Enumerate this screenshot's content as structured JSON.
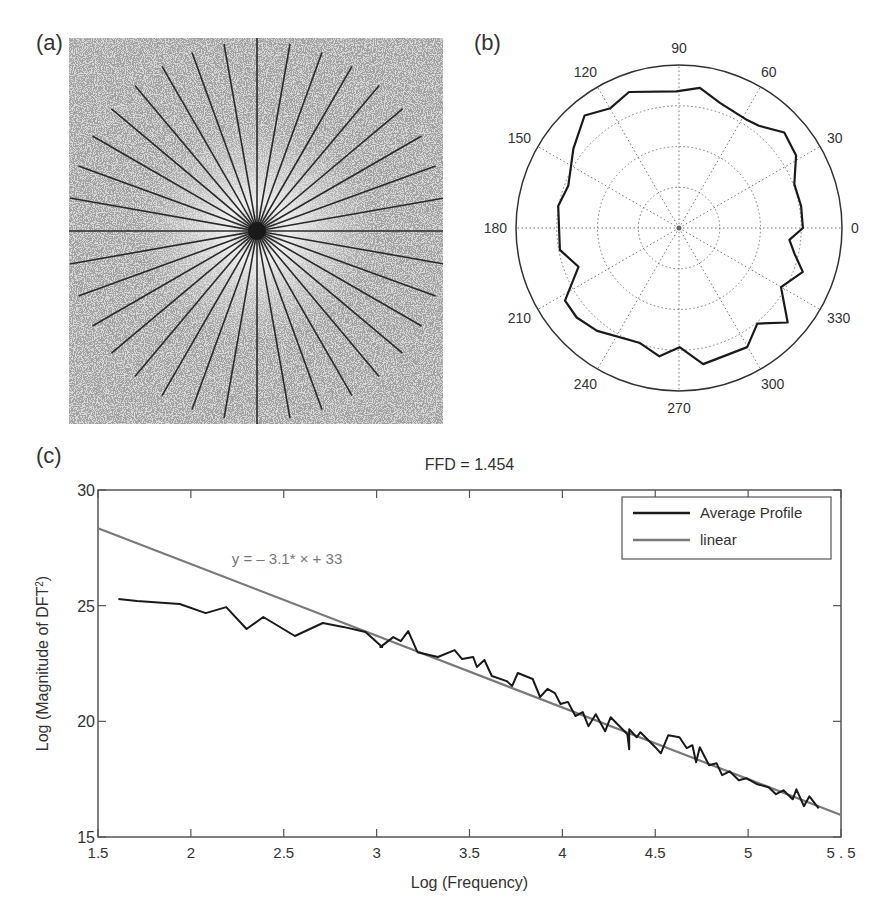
{
  "figure": {
    "panel_labels": {
      "a": "(a)",
      "b": "(b)",
      "c": "(c)"
    }
  },
  "chart_data": [
    {
      "panel": "a",
      "type": "image",
      "description": "2D Fourier power spectrum with radial sampling lines",
      "radial_line_count": 36,
      "angle_step_deg": 10,
      "background_color": "#d9d9d9",
      "line_color": "#2a2a2a"
    },
    {
      "panel": "b",
      "type": "polar",
      "title": "",
      "angle_tick_labels": [
        "0",
        "30",
        "60",
        "90",
        "120",
        "150",
        "180",
        "210",
        "240",
        "270",
        "300",
        "330"
      ],
      "radial_rings": 4,
      "grid": "dotted",
      "series": [
        {
          "name": "directional profile",
          "points": [
            [
              0,
              0.76
            ],
            [
              10.2,
              0.761
            ],
            [
              20.8,
              0.757
            ],
            [
              31.8,
              0.845
            ],
            [
              42.2,
              0.872
            ],
            [
              52,
              0.796
            ],
            [
              57.7,
              0.783
            ],
            [
              71.7,
              0.807
            ],
            [
              81.5,
              0.869
            ],
            [
              91.1,
              0.839
            ],
            [
              110.2,
              0.889
            ],
            [
              119.8,
              0.847
            ],
            [
              130,
              0.901
            ],
            [
              143.1,
              0.81
            ],
            [
              159.1,
              0.727
            ],
            [
              169.7,
              0.753
            ],
            [
              190.4,
              0.743
            ],
            [
              201.1,
              0.661
            ],
            [
              212.5,
              0.829
            ],
            [
              221.2,
              0.834
            ],
            [
              231.5,
              0.807
            ],
            [
              250.9,
              0.745
            ],
            [
              261.3,
              0.796
            ],
            [
              270.3,
              0.731
            ],
            [
              280.1,
              0.848
            ],
            [
              299.8,
              0.842
            ],
            [
              309.3,
              0.758
            ],
            [
              319,
              0.884
            ],
            [
              329.9,
              0.723
            ],
            [
              340.5,
              0.806
            ],
            [
              347.6,
              0.725
            ],
            [
              353.9,
              0.681
            ]
          ]
        }
      ]
    },
    {
      "panel": "c",
      "type": "line",
      "title": "FFD = 1.454",
      "xlabel": "Log (Frequency)",
      "ylabel": "Log (Magnitude of DFT",
      "ylabel_sup": "2",
      "ylabel_close": ")",
      "xlim": [
        1.5,
        5.5
      ],
      "ylim": [
        15,
        30
      ],
      "xticks": [
        1.5,
        2,
        2.5,
        3,
        3.5,
        4,
        4.5,
        5,
        5.5
      ],
      "xtick_labels": [
        "1.5",
        "2",
        "2.5",
        "3",
        "3.5",
        "4",
        "4.5",
        "5",
        "5 . 5"
      ],
      "yticks": [
        15,
        20,
        25,
        30
      ],
      "ytick_labels": [
        "15",
        "20",
        "25",
        "30"
      ],
      "grid": false,
      "legend": {
        "position": "upper right",
        "entries": [
          "Average Profile",
          "linear"
        ]
      },
      "annotation": {
        "text": "y = – 3.1* × + 33",
        "x": 2.22,
        "y": 26.8
      },
      "series": [
        {
          "name": "Average Profile",
          "color": "#1a1a1a",
          "x": [
            1.61,
            1.71,
            1.94,
            2.08,
            2.19,
            2.3,
            2.39,
            2.56,
            2.71,
            2.82,
            2.94,
            3.03,
            3.02,
            3.09,
            3.13,
            3.17,
            3.22,
            3.33,
            3.42,
            3.46,
            3.52,
            3.54,
            3.58,
            3.62,
            3.7,
            3.73,
            3.76,
            3.84,
            3.88,
            3.92,
            3.96,
            3.99,
            4.03,
            4.07,
            4.11,
            4.14,
            4.18,
            4.23,
            4.26,
            4.35,
            4.36,
            4.36,
            4.4,
            4.42,
            4.5,
            4.53,
            4.57,
            4.63,
            4.67,
            4.7,
            4.72,
            4.74,
            4.79,
            4.83,
            4.86,
            4.9,
            4.95,
            4.99,
            5.05,
            5.11,
            5.15,
            5.19,
            5.24,
            5.26,
            5.3,
            5.33,
            5.38
          ],
          "y": [
            25.29,
            25.2,
            25.07,
            24.68,
            24.94,
            23.99,
            24.51,
            23.69,
            24.25,
            24.08,
            23.86,
            23.21,
            23.21,
            23.64,
            23.47,
            23.9,
            22.99,
            22.78,
            23.08,
            22.69,
            22.78,
            22.35,
            22.65,
            21.96,
            21.74,
            21.53,
            22.09,
            21.83,
            21.05,
            21.4,
            21.22,
            20.75,
            20.84,
            20.23,
            20.4,
            19.79,
            20.31,
            19.57,
            20.18,
            19.44,
            18.79,
            19.66,
            19.31,
            19.53,
            18.88,
            18.62,
            19.4,
            19.31,
            18.84,
            18.97,
            18.23,
            18.88,
            18.1,
            18.19,
            17.67,
            17.84,
            17.45,
            17.54,
            17.28,
            17.15,
            16.85,
            17.02,
            16.63,
            17.06,
            16.33,
            16.76,
            16.24,
            16.59
          ]
        },
        {
          "name": "linear",
          "color": "#7a7a7a",
          "slope": -3.1,
          "intercept": 33,
          "x": [
            1.5,
            5.5
          ],
          "y": [
            28.35,
            15.95
          ]
        }
      ]
    }
  ]
}
